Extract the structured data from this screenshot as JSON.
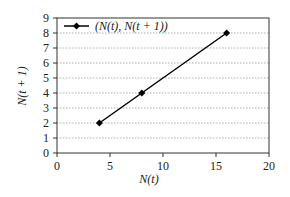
{
  "chart_data": {
    "type": "line",
    "title": "",
    "xlabel": "N(t)",
    "ylabel": "N(t + 1)",
    "xlim": [
      0,
      20
    ],
    "ylim": [
      0,
      9
    ],
    "x_ticks": [
      "0",
      "5",
      "10",
      "15",
      "20"
    ],
    "y_ticks": [
      "0",
      "1",
      "2",
      "3",
      "4",
      "5",
      "6",
      "7",
      "8",
      "9"
    ],
    "grid": "horizontal dotted",
    "legend_position": "top-left inside",
    "series": [
      {
        "name": "(N(t), N(t + 1))",
        "x": [
          4,
          8,
          16
        ],
        "y": [
          2,
          4,
          8
        ],
        "marker": "diamond",
        "color": "#000000"
      }
    ]
  }
}
